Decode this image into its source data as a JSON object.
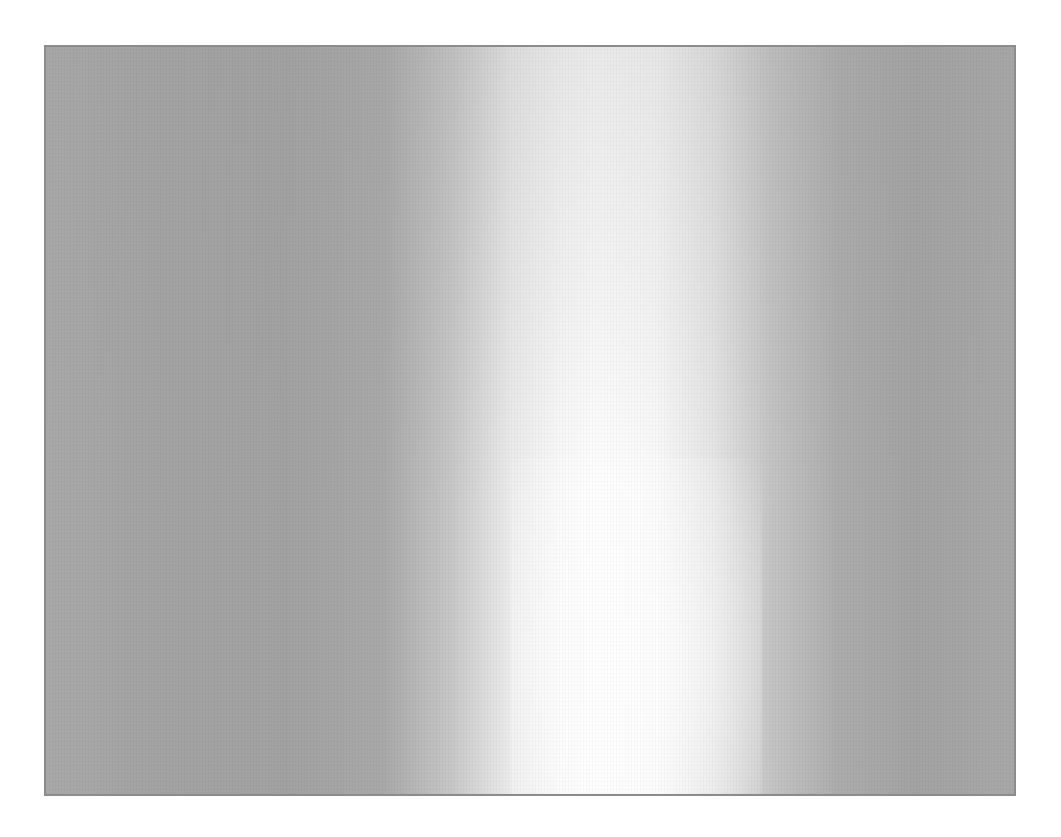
{
  "image": {
    "description": "Gray gradient panel with a bright vertical highlight band",
    "panel": {
      "x": 44,
      "y": 45,
      "width": 972,
      "height": 751
    },
    "colors": {
      "background": "#ffffff",
      "border": "#8c8c8c",
      "edge_gray": "#a3a3a3",
      "highlight": "#ffffff"
    },
    "highlight_center_x_pct": 57
  }
}
